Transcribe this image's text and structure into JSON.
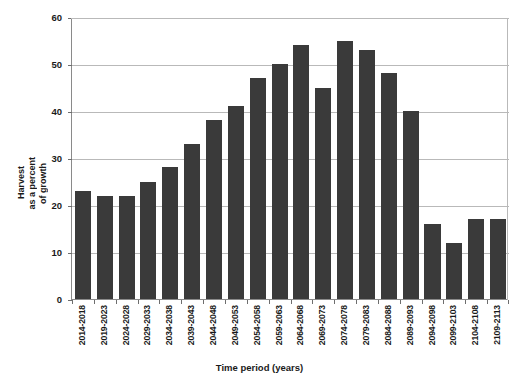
{
  "chart_data": {
    "type": "bar",
    "title": "",
    "xlabel": "Time period (years)",
    "ylabel": "Harvest as a percent of growth",
    "ylabel_lines": [
      "Harvest",
      "as a percent",
      "of growth"
    ],
    "ylim": [
      0,
      60
    ],
    "yticks": [
      0,
      10,
      20,
      30,
      40,
      50,
      60
    ],
    "ytick_labels": [
      "0",
      "10",
      "20",
      "30",
      "40",
      "50",
      "60"
    ],
    "grid": true,
    "grid_axis": "y",
    "legend": false,
    "bar_color": "#3a3a3a",
    "grid_color": "#b9b9b9",
    "axis_color": "#8a8a8a",
    "categories": [
      "2014-2018",
      "2019-2023",
      "2024-2028",
      "2029-2033",
      "2034-2038",
      "2039-2043",
      "2044-2048",
      "2049-2053",
      "2054-2058",
      "2059-2063",
      "2064-2068",
      "2069-2073",
      "2074-2078",
      "2079-2083",
      "2084-2088",
      "2089-2093",
      "2094-2098",
      "2099-2103",
      "2104-2108",
      "2109-2113"
    ],
    "values": [
      23,
      22,
      22,
      25,
      28,
      33,
      38,
      41,
      47,
      50,
      54,
      45,
      55,
      53,
      48,
      40,
      16,
      12,
      17,
      17
    ]
  }
}
